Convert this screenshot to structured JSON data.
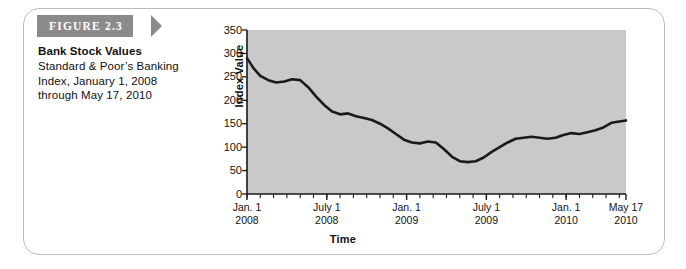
{
  "figure": {
    "banner_label": "FIGURE 2.3",
    "title": "Bank Stock Values",
    "description_lines": [
      "Standard & Poor’s Banking",
      "Index, January 1, 2008",
      "through May 17, 2010"
    ]
  },
  "colors": {
    "banner_bg": "#8b8b8b",
    "plot_bg": "#c9c9c9",
    "line": "#1a1a1a",
    "frame_border": "#bcbcbc",
    "axis": "#1a1a1a",
    "text": "#111111"
  },
  "chart_data": {
    "type": "line",
    "title": "Bank Stock Values",
    "subtitle": "Standard & Poor’s Banking Index, January 1, 2008 through May 17, 2010",
    "xlabel": "Time",
    "ylabel": "Index Value",
    "ylim": [
      0,
      350
    ],
    "yticks": [
      0,
      50,
      100,
      150,
      200,
      250,
      300,
      350
    ],
    "ytick_labels": [
      "0",
      "50",
      "100",
      "150",
      "200",
      "250",
      "300",
      "350"
    ],
    "xlim": [
      0,
      28.5
    ],
    "xtick_major": [
      {
        "pos": 0,
        "line1": "Jan. 1",
        "line2": "2008"
      },
      {
        "pos": 6,
        "line1": "July 1",
        "line2": "2008"
      },
      {
        "pos": 12,
        "line1": "Jan. 1",
        "line2": "2009"
      },
      {
        "pos": 18,
        "line1": "July 1",
        "line2": "2009"
      },
      {
        "pos": 24,
        "line1": "Jan. 1",
        "line2": "2010"
      },
      {
        "pos": 28.5,
        "line1": "May 17",
        "line2": "2010"
      }
    ],
    "xtick_minor_step": 1,
    "grid": false,
    "legend": null,
    "series": [
      {
        "name": "S&P Banking Index",
        "x": [
          0,
          0.5,
          1.0,
          1.6,
          2.2,
          2.8,
          3.4,
          4.0,
          4.6,
          5.2,
          5.8,
          6.4,
          7.0,
          7.6,
          8.2,
          8.8,
          9.4,
          10.0,
          10.6,
          11.2,
          11.8,
          12.4,
          13.0,
          13.6,
          14.2,
          14.8,
          15.4,
          16.0,
          16.6,
          17.2,
          17.8,
          18.4,
          19.0,
          19.6,
          20.2,
          20.8,
          21.4,
          22.0,
          22.6,
          23.2,
          23.8,
          24.4,
          25.0,
          25.6,
          26.2,
          26.8,
          27.4,
          28.5
        ],
        "y": [
          290,
          268,
          252,
          243,
          238,
          240,
          245,
          243,
          228,
          208,
          190,
          176,
          170,
          172,
          166,
          162,
          158,
          150,
          140,
          128,
          116,
          110,
          108,
          112,
          110,
          96,
          80,
          70,
          68,
          70,
          78,
          90,
          100,
          110,
          118,
          120,
          122,
          120,
          118,
          120,
          126,
          130,
          128,
          132,
          136,
          142,
          152,
          157
        ]
      }
    ]
  }
}
